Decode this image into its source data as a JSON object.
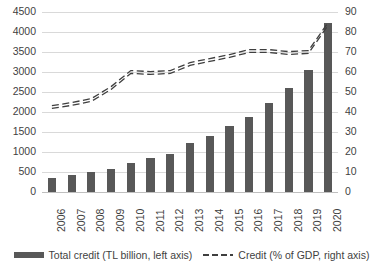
{
  "chart_data": {
    "type": "bar",
    "title": "",
    "subtitle": "",
    "xlabel": "",
    "ylabel": "",
    "categories": [
      "2006",
      "2007",
      "2008",
      "2009",
      "2010",
      "2011",
      "2012",
      "2013",
      "2014",
      "2015",
      "2016",
      "2017",
      "2018",
      "2019",
      "2020"
    ],
    "series": [
      {
        "name": "Total credit (TL billion, left axis)",
        "type": "bar",
        "axis": "left",
        "color": "#585858",
        "values": [
          350,
          420,
          490,
          580,
          730,
          860,
          960,
          1220,
          1410,
          1650,
          1880,
          2230,
          2610,
          3040,
          4220
        ]
      },
      {
        "name": "Credit (% of GDP, right axis)",
        "type": "line",
        "style": "dashed",
        "axis": "right",
        "color": "#3f3f3f",
        "values": [
          42.5,
          44,
          46,
          52,
          60,
          59.5,
          60,
          64,
          66,
          68,
          70.5,
          70.5,
          69.5,
          70,
          84
        ]
      }
    ],
    "axes": {
      "left": {
        "min": 0,
        "max": 4500,
        "step": 500,
        "ticks": [
          "4500",
          "4000",
          "3500",
          "3000",
          "2500",
          "2000",
          "1500",
          "1000",
          "500",
          "0"
        ],
        "tick_values": [
          4500,
          4000,
          3500,
          3000,
          2500,
          2000,
          1500,
          1000,
          500,
          0
        ]
      },
      "right": {
        "min": 0,
        "max": 90,
        "step": 10,
        "ticks": [
          "90",
          "80",
          "70",
          "60",
          "50",
          "40",
          "30",
          "20",
          "10",
          "0"
        ],
        "tick_values": [
          90,
          80,
          70,
          60,
          50,
          40,
          30,
          20,
          10,
          0
        ]
      }
    },
    "grid": true,
    "legend_position": "bottom"
  },
  "legend": {
    "entries": [
      {
        "label": "Total credit (TL billion, left axis)",
        "marker": "bar-swatch"
      },
      {
        "label": "Credit (% of GDP, right axis)",
        "marker": "dashed-line-swatch"
      }
    ]
  }
}
